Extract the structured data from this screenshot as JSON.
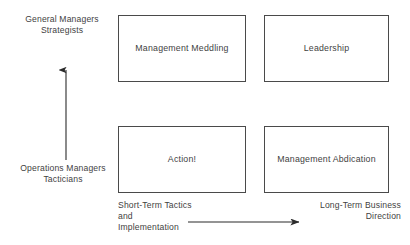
{
  "diagram": {
    "type": "2x2-matrix",
    "colors": {
      "text": "#3f3f3f",
      "box_border": "#4a4a4a",
      "arrow": "#2b2b2b",
      "background": "#ffffff"
    },
    "vertical_axis": {
      "name": "capability-axis",
      "direction": "upward",
      "low_label": "Operations Managers\nTacticians",
      "high_label": "General Managers\nStrategists"
    },
    "horizontal_axis": {
      "name": "time-horizon-axis",
      "direction": "rightward",
      "low_label": "Short-Term Tactics and\nImplementation",
      "high_label": "Long-Term Business\nDirection"
    },
    "quadrants": [
      {
        "id": "top-left",
        "label": "Management Meddling",
        "row": "high",
        "column": "short-term"
      },
      {
        "id": "top-right",
        "label": "Leadership",
        "row": "high",
        "column": "long-term"
      },
      {
        "id": "bottom-left",
        "label": "Action!",
        "row": "low",
        "column": "short-term"
      },
      {
        "id": "bottom-right",
        "label": "Management Abdication",
        "row": "low",
        "column": "long-term"
      }
    ]
  }
}
